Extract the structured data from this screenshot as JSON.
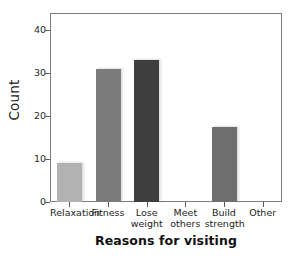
{
  "chart_data": {
    "type": "bar",
    "title": "",
    "xlabel": "Reasons for visiting",
    "ylabel": "Count",
    "categories": [
      "Relaxation",
      "Fitness",
      "Lose weight",
      "Meet others",
      "Build strength",
      "Other"
    ],
    "category_lines": [
      [
        "Relaxation",
        ""
      ],
      [
        "Fitness",
        ""
      ],
      [
        "Lose",
        "weight"
      ],
      [
        "Meet",
        "others"
      ],
      [
        "Build",
        "strength"
      ],
      [
        "Other",
        ""
      ]
    ],
    "values": [
      9,
      31,
      33,
      0,
      17.5,
      0
    ],
    "bar_colors": [
      "#b2b2b2",
      "#7b7b7b",
      "#3e3e3e",
      "#7b7b7b",
      "#6e6e6e",
      "#7b7b7b"
    ],
    "ylim": [
      0,
      44
    ],
    "yticks": [
      0,
      10,
      20,
      30,
      40
    ],
    "ytick_labels": [
      "0",
      "10",
      "20",
      "30",
      "40"
    ],
    "grid": false,
    "legend": "none",
    "frame": "box",
    "background_color": "#ffffff",
    "axis_color": "#7d7d7d"
  }
}
